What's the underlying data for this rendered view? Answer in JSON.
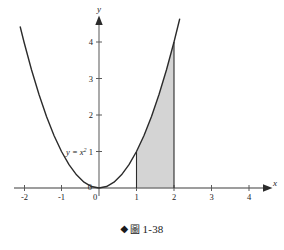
{
  "figure": {
    "caption": {
      "bullet": "◆",
      "label_cjk": "圖",
      "number": "1-38"
    }
  },
  "chart_data": {
    "type": "line",
    "title": "",
    "subtitle": "",
    "xlabel": "x",
    "ylabel": "y",
    "xlim": [
      -2.3,
      4.4
    ],
    "ylim": [
      -0.35,
      4.7
    ],
    "grid": false,
    "legend": "none",
    "x_ticks": [
      -2,
      -1,
      0,
      1,
      2,
      3,
      4
    ],
    "x_tick_labels": [
      "-2",
      "-1",
      "0",
      "1",
      "2",
      "3",
      "4"
    ],
    "y_ticks": [
      0,
      1,
      2,
      3,
      4
    ],
    "y_tick_labels": [
      "0",
      "1",
      "2",
      "3",
      "4"
    ],
    "series": [
      {
        "name": "y = x^2",
        "equation": "y = x²",
        "label_text": "y = x",
        "label_exponent": "2",
        "label_x": -0.88,
        "label_y": 1.0,
        "color": "#2b2b2b",
        "x": [
          -2.1,
          -2.0,
          -1.8,
          -1.6,
          -1.4,
          -1.2,
          -1.0,
          -0.8,
          -0.6,
          -0.4,
          -0.2,
          0.0,
          0.2,
          0.4,
          0.6,
          0.8,
          1.0,
          1.2,
          1.4,
          1.6,
          1.8,
          2.0,
          2.15
        ],
        "y": [
          4.41,
          4.0,
          3.24,
          2.56,
          1.96,
          1.44,
          1.0,
          0.64,
          0.36,
          0.16,
          0.04,
          0.0,
          0.04,
          0.16,
          0.36,
          0.64,
          1.0,
          1.44,
          1.96,
          2.56,
          3.24,
          4.0,
          4.62
        ]
      }
    ],
    "shaded_region": {
      "label": "area under y = x² from x=1 to x=2",
      "x_from": 1,
      "x_to": 2,
      "y_from": 0,
      "fill_color": "#d4d4d4",
      "edge_color": "#2b2b2b",
      "left_boundary_top": 1,
      "right_boundary_top": 4
    },
    "axis_color": "#7d7d7d",
    "annotations": []
  }
}
